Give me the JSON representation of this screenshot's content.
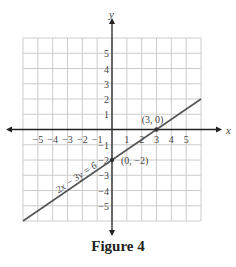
{
  "caption": "Figure 4",
  "chart_data": {
    "type": "line",
    "title": "",
    "xlabel": "x",
    "ylabel": "y",
    "xlim": [
      -6,
      6
    ],
    "ylim": [
      -6,
      6
    ],
    "grid": true,
    "x_ticks": [
      "-5",
      "-4",
      "-3",
      "-2",
      "-1",
      "1",
      "2",
      "3",
      "4",
      "5"
    ],
    "y_ticks": [
      "5",
      "4",
      "3",
      "2",
      "1",
      "-1",
      "-2",
      "-3",
      "-4",
      "-5"
    ],
    "series": [
      {
        "name": "2x - 3y = 6",
        "x": [
          -6,
          6
        ],
        "y": [
          -6,
          2
        ]
      }
    ],
    "points": [
      {
        "label": "(3, 0)",
        "x": 3,
        "y": 0
      },
      {
        "label": "(0, -2)",
        "x": 0,
        "y": -2
      }
    ],
    "annotations": [
      "2x − 3y = 6",
      "(3, 0)",
      "(0, −2)"
    ],
    "colors": {
      "line": "#555555",
      "grid": "#cccccc",
      "axis": "#222222",
      "text": "#444444"
    }
  }
}
